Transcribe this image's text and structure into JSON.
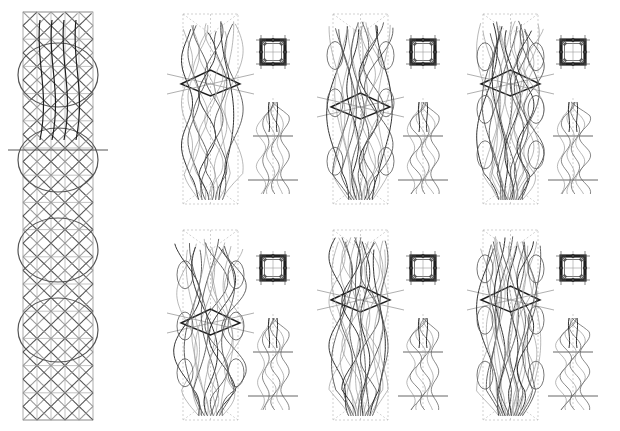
{
  "figure": {
    "colors": {
      "background": "#ffffff",
      "ink_dark": "#1e1e1e",
      "ink_mid": "#555555",
      "ink_light": "#9a9a9a",
      "guide": "#b4b4b4"
    }
  },
  "lattice_column": {
    "label": "lattice-column",
    "diamond_rows": 30,
    "diamond_cols": 5,
    "bulges": 4
  },
  "variants": [
    {
      "id": "variant-1",
      "row": 1,
      "col": 1,
      "style": "flame",
      "strands": 8,
      "seed": 3
    },
    {
      "id": "variant-2",
      "row": 1,
      "col": 2,
      "style": "loop",
      "strands": 10,
      "seed": 7
    },
    {
      "id": "variant-3",
      "row": 1,
      "col": 3,
      "style": "flame-dense",
      "strands": 12,
      "seed": 11
    },
    {
      "id": "variant-4",
      "row": 2,
      "col": 1,
      "style": "loop",
      "strands": 9,
      "seed": 5
    },
    {
      "id": "variant-5",
      "row": 2,
      "col": 2,
      "style": "flame",
      "strands": 11,
      "seed": 13
    },
    {
      "id": "variant-6",
      "row": 2,
      "col": 3,
      "style": "flame-dense",
      "strands": 12,
      "seed": 17
    }
  ]
}
